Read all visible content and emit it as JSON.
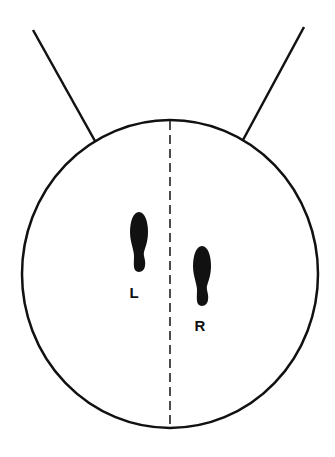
{
  "diagram": {
    "colors": {
      "stroke": "#111111",
      "background": "#ffffff",
      "foot": "#111111"
    },
    "feet": [
      {
        "side": "left",
        "label": "L"
      },
      {
        "side": "right",
        "label": "R"
      }
    ]
  }
}
